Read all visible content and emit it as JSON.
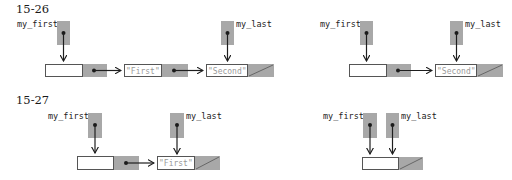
{
  "figures": [
    {
      "label": "15-26",
      "panels": [
        {
          "id": "left",
          "pointers": [
            {
              "name": "my_first",
              "label_side": "left"
            },
            {
              "name": "my_last",
              "label_side": "right"
            }
          ],
          "nodes": [
            {
              "value": "",
              "next": "node"
            },
            {
              "value": "\"First\"",
              "next": "node"
            },
            {
              "value": "\"Second\"",
              "next": "null"
            }
          ]
        },
        {
          "id": "right",
          "pointers": [
            {
              "name": "my_first",
              "label_side": "left"
            },
            {
              "name": "my_last",
              "label_side": "right"
            }
          ],
          "nodes": [
            {
              "value": "",
              "next": "node"
            },
            {
              "value": "\"Second\"",
              "next": "null"
            }
          ]
        }
      ]
    },
    {
      "label": "15-27",
      "panels": [
        {
          "id": "left",
          "pointers": [
            {
              "name": "my_first",
              "label_side": "left"
            },
            {
              "name": "my_last",
              "label_side": "right"
            }
          ],
          "nodes": [
            {
              "value": "",
              "next": "node"
            },
            {
              "value": "\"First\"",
              "next": "null"
            }
          ]
        },
        {
          "id": "right",
          "pointers": [
            {
              "name": "my_first",
              "label_side": "left"
            },
            {
              "name": "my_last",
              "label_side": "right"
            }
          ],
          "nodes": [
            {
              "value": "",
              "next": "null"
            }
          ]
        }
      ]
    }
  ],
  "colors": {
    "pointer_fill": "#a8a8a8",
    "box_stroke": "#555555",
    "arrow": "#1e1e1e",
    "value_text": "#9a9a9a"
  }
}
